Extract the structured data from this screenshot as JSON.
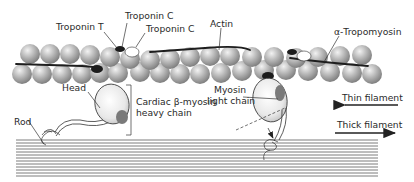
{
  "figure": {
    "labels": {
      "troponin_t": "Troponin T",
      "troponin_c_1": "Troponin C",
      "troponin_c_2": "Troponin C",
      "actin": "Actin",
      "tropomyosin": "α-Tropomyosin",
      "head": "Head",
      "heavy_chain_line1": "Cardiac β-myosin",
      "heavy_chain_line2": "heavy chain",
      "myosin_light_chain_line1": "Myosin",
      "myosin_light_chain_line2": "light chain",
      "rod": "Rod",
      "thin_filament": "Thin filament",
      "thick_filament": "Thick filament"
    },
    "arrows": {
      "thin_filament_direction": "left",
      "thick_filament_direction": "right"
    },
    "colors": {
      "actin_bead": "#a8a8a8",
      "actin_highlight": "#e6e6e6",
      "tropomyosin_strand": "#1e1e1e",
      "troponin_dark": "#1c1c1c",
      "troponin_c_light": "#ffffff",
      "myosin_head": "#ececec",
      "light_chain": "#7a7a7a",
      "thick_filament_lines": "#555555"
    }
  }
}
